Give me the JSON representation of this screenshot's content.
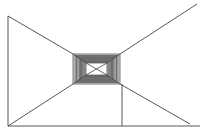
{
  "diagram": {
    "type": "perspective-tunnel-line-drawing",
    "stroke_color": "#444444",
    "fill_color": "#888888",
    "background": "#ffffff",
    "caption_fragment": "",
    "outer_rect": {
      "x1": 73,
      "y1": 54,
      "x2": 120,
      "y2": 84
    },
    "inner_rect": {
      "x1": 86,
      "y1": 63,
      "x2": 107,
      "y2": 75
    },
    "nested_rect_count": 10,
    "lines": [
      {
        "name": "left-wall-edge",
        "x1": 8,
        "y1": 16,
        "x2": 8,
        "y2": 126
      },
      {
        "name": "floor-baseline",
        "x1": 8,
        "y1": 126,
        "x2": 200,
        "y2": 126
      },
      {
        "name": "top-left-diagonal",
        "x1": 8,
        "y1": 16,
        "x2": 73,
        "y2": 54
      },
      {
        "name": "top-right-diagonal",
        "x1": 120,
        "y1": 54,
        "x2": 197,
        "y2": 4
      },
      {
        "name": "bottom-left-diagonal",
        "x1": 8,
        "y1": 126,
        "x2": 73,
        "y2": 84
      },
      {
        "name": "bottom-right-diagonal",
        "x1": 120,
        "y1": 84,
        "x2": 190,
        "y2": 124
      },
      {
        "name": "vertical-post",
        "x1": 122,
        "y1": 84,
        "x2": 122,
        "y2": 126
      }
    ]
  }
}
